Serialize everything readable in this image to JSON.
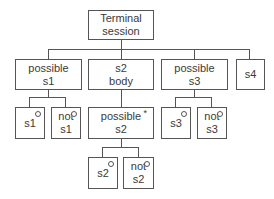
{
  "diagram": {
    "type": "tree",
    "root": {
      "id": "terminal",
      "lines": [
        "Terminal",
        "session"
      ]
    },
    "level1": [
      {
        "id": "possible-s1",
        "lines": [
          "possible",
          "s1"
        ]
      },
      {
        "id": "s2-body",
        "lines": [
          "s2",
          "body"
        ]
      },
      {
        "id": "possible-s3",
        "lines": [
          "possible",
          "s3"
        ]
      },
      {
        "id": "s4",
        "lines": [
          "s4"
        ]
      }
    ],
    "level2": [
      {
        "id": "s1",
        "parent": "possible-s1",
        "lines": [
          "s1"
        ],
        "marker": "o"
      },
      {
        "id": "not-s1",
        "parent": "possible-s1",
        "lines": [
          "not",
          "s1"
        ],
        "marker": "o"
      },
      {
        "id": "possible-s2",
        "parent": "s2-body",
        "lines": [
          "possible",
          "s2"
        ],
        "marker": "*"
      },
      {
        "id": "s3",
        "parent": "possible-s3",
        "lines": [
          "s3"
        ],
        "marker": "o"
      },
      {
        "id": "not-s3",
        "parent": "possible-s3",
        "lines": [
          "not",
          "s3"
        ],
        "marker": "o"
      }
    ],
    "level3": [
      {
        "id": "s2",
        "parent": "possible-s2",
        "lines": [
          "s2"
        ],
        "marker": "o"
      },
      {
        "id": "not-s2",
        "parent": "possible-s2",
        "lines": [
          "not",
          "s2"
        ],
        "marker": "o"
      }
    ]
  }
}
